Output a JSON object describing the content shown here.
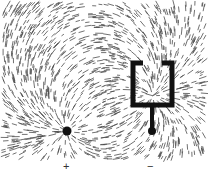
{
  "figure": {
    "labels": {
      "positive": "+",
      "negative": "−"
    },
    "colors": {
      "ink": "#111111",
      "background": "#ffffff"
    }
  }
}
